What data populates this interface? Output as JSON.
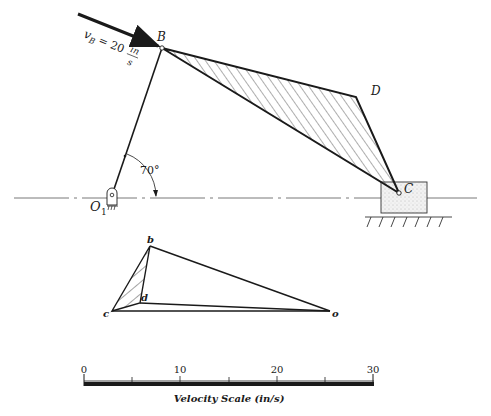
{
  "mechanism": {
    "points": {
      "O1": {
        "label": "O",
        "sub": "1",
        "x": 112,
        "y": 197
      },
      "B": {
        "label": "B",
        "x": 162,
        "y": 48
      },
      "D": {
        "label": "D",
        "x": 356,
        "y": 97
      },
      "C": {
        "label": "C",
        "x": 399,
        "y": 193
      }
    },
    "angle_label": "70°",
    "velocity_label": {
      "v": "v",
      "sub": "B",
      "eq": "= 20",
      "num": "in",
      "den": "s"
    }
  },
  "velocity_polygon": {
    "points": {
      "b": {
        "label": "b",
        "x": 150,
        "y": 246
      },
      "c": {
        "label": "c",
        "x": 112,
        "y": 311
      },
      "d": {
        "label": "d",
        "x": 140,
        "y": 303
      },
      "o": {
        "label": "o",
        "x": 330,
        "y": 311
      }
    }
  },
  "scale": {
    "title": "Velocity Scale (in/s)",
    "ticks": [
      "0",
      "10",
      "20",
      "30"
    ],
    "min": 0,
    "max": 30,
    "minor_step": 5
  },
  "colors": {
    "ink": "#1a1a1a",
    "hatch": "#333333",
    "block_fill": "#ececec"
  }
}
